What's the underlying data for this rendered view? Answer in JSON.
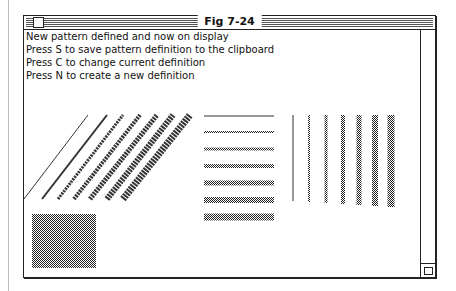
{
  "window": {
    "title": "Fig 7-24",
    "close_box_icon": "close-box-icon",
    "grow_box_icon": "grow-box-icon"
  },
  "messages": [
    "New pattern defined and now on display",
    "Press S to save pattern definition to the clipboard",
    "Press C to change current definition",
    "Press N to create a new definition"
  ],
  "drawing": {
    "diagonal_lines": [
      {
        "x1": 24,
        "y1": 199,
        "x2": 88,
        "y2": 115,
        "w": 1
      },
      {
        "x1": 42,
        "y1": 199,
        "x2": 107,
        "y2": 115,
        "w": 2
      },
      {
        "x1": 58,
        "y1": 199,
        "x2": 123,
        "y2": 115,
        "w": 3
      },
      {
        "x1": 74,
        "y1": 199,
        "x2": 140,
        "y2": 115,
        "w": 4
      },
      {
        "x1": 90,
        "y1": 199,
        "x2": 157,
        "y2": 115,
        "w": 5
      },
      {
        "x1": 107,
        "y1": 199,
        "x2": 173,
        "y2": 115,
        "w": 6
      },
      {
        "x1": 123,
        "y1": 199,
        "x2": 190,
        "y2": 115,
        "w": 7
      }
    ],
    "horizontal_lines": [
      {
        "y": 116,
        "w": 1
      },
      {
        "y": 132,
        "w": 2
      },
      {
        "y": 149,
        "w": 3
      },
      {
        "y": 166,
        "w": 4
      },
      {
        "y": 183,
        "w": 5
      },
      {
        "y": 200,
        "w": 6
      },
      {
        "y": 217,
        "w": 7
      }
    ],
    "vertical_lines": [
      {
        "x": 293,
        "w": 1
      },
      {
        "x": 309,
        "w": 2
      },
      {
        "x": 326,
        "w": 3
      },
      {
        "x": 343,
        "w": 4
      },
      {
        "x": 359,
        "w": 5
      },
      {
        "x": 375,
        "w": 6
      },
      {
        "x": 391,
        "w": 7
      }
    ],
    "filled_rect": {
      "x": 32,
      "y": 214,
      "w": 64,
      "h": 54
    },
    "ink_color": "#333333"
  }
}
